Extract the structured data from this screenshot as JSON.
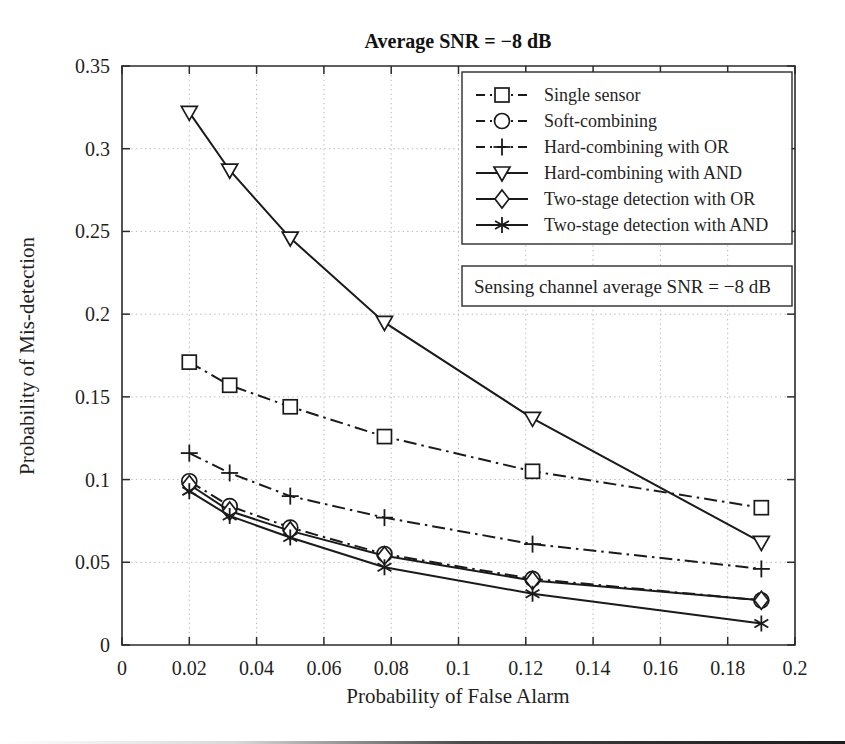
{
  "figure": {
    "title": "Average SNR = −8 dB",
    "annotation": "Sensing channel average SNR = −8 dB"
  },
  "axes": {
    "x_label": "Probability of False Alarm",
    "y_label": "Probability of Mis-detection",
    "x_ticks": [
      "0",
      "0.02",
      "0.04",
      "0.06",
      "0.08",
      "0.1",
      "0.12",
      "0.14",
      "0.16",
      "0.18",
      "0.2"
    ],
    "y_ticks": [
      "0",
      "0.05",
      "0.1",
      "0.15",
      "0.2",
      "0.25",
      "0.3",
      "0.35"
    ]
  },
  "legend": {
    "items": [
      {
        "label": "Single sensor",
        "marker": "square",
        "linestyle": "dashdot"
      },
      {
        "label": "Soft-combining",
        "marker": "circle",
        "linestyle": "dashdot"
      },
      {
        "label": "Hard-combining with OR",
        "marker": "plus",
        "linestyle": "dashdot"
      },
      {
        "label": "Hard-combining with AND",
        "marker": "triangle-down",
        "linestyle": "solid"
      },
      {
        "label": "Two-stage detection with OR",
        "marker": "diamond",
        "linestyle": "solid"
      },
      {
        "label": "Two-stage detection with AND",
        "marker": "asterisk",
        "linestyle": "solid"
      }
    ]
  },
  "chart_data": {
    "type": "line",
    "title": "Average SNR = −8 dB",
    "xlabel": "Probability of False Alarm",
    "ylabel": "Probability of Mis-detection",
    "xlim": [
      0,
      0.2
    ],
    "ylim": [
      0,
      0.35
    ],
    "xticks": [
      0,
      0.02,
      0.04,
      0.06,
      0.08,
      0.1,
      0.12,
      0.14,
      0.16,
      0.18,
      0.2
    ],
    "yticks": [
      0,
      0.05,
      0.1,
      0.15,
      0.2,
      0.25,
      0.3,
      0.35
    ],
    "grid": true,
    "legend_position": "top-right",
    "annotations": [
      "Sensing channel average SNR = −8 dB"
    ],
    "x": [
      0.02,
      0.032,
      0.05,
      0.078,
      0.122,
      0.19
    ],
    "series": [
      {
        "name": "Single sensor",
        "marker": "square",
        "linestyle": "dashdot",
        "values": [
          0.171,
          0.157,
          0.144,
          0.126,
          0.105,
          0.083
        ]
      },
      {
        "name": "Soft-combining",
        "marker": "circle",
        "linestyle": "dashdot",
        "values": [
          0.099,
          0.084,
          0.071,
          0.055,
          0.04,
          0.027
        ]
      },
      {
        "name": "Hard-combining with OR",
        "marker": "plus",
        "linestyle": "dashdot",
        "values": [
          0.116,
          0.104,
          0.09,
          0.077,
          0.061,
          0.046
        ]
      },
      {
        "name": "Hard-combining with AND",
        "marker": "triangle-down",
        "linestyle": "solid",
        "values": [
          0.322,
          0.287,
          0.246,
          0.195,
          0.137,
          0.062
        ]
      },
      {
        "name": "Two-stage detection with OR",
        "marker": "diamond",
        "linestyle": "solid",
        "values": [
          0.097,
          0.081,
          0.069,
          0.054,
          0.039,
          0.027
        ]
      },
      {
        "name": "Two-stage detection with AND",
        "marker": "asterisk",
        "linestyle": "solid",
        "values": [
          0.093,
          0.078,
          0.065,
          0.047,
          0.031,
          0.013
        ]
      }
    ]
  },
  "colors": {
    "ink": "#1a1a1a",
    "grid": "#b9b9b9",
    "background": "#ffffff"
  }
}
